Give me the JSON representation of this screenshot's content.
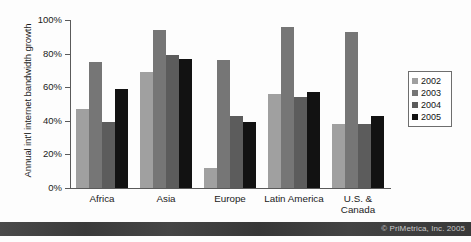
{
  "chart_data": {
    "type": "bar",
    "title": "",
    "subtitle": "",
    "xlabel": "",
    "ylabel": "Annual int'l internet bandwidth growth",
    "ylim": [
      0,
      100
    ],
    "yticks": [
      "0%",
      "20%",
      "40%",
      "60%",
      "80%",
      "100%"
    ],
    "ytick_values": [
      0,
      20,
      40,
      60,
      80,
      100
    ],
    "grid": false,
    "legend_position": "right",
    "categories": [
      "Africa",
      "Asia",
      "Europe",
      "Latin America",
      "U.S. &\nCanada"
    ],
    "series": [
      {
        "name": "2002",
        "color": "#a0a0a0",
        "values": [
          47,
          69,
          12,
          56,
          38
        ]
      },
      {
        "name": "2003",
        "color": "#767676",
        "values": [
          75,
          94,
          76,
          96,
          93
        ]
      },
      {
        "name": "2004",
        "color": "#5c5c5c",
        "values": [
          39,
          79,
          43,
          54,
          38
        ]
      },
      {
        "name": "2005",
        "color": "#121212",
        "values": [
          59,
          77,
          39,
          57,
          43
        ]
      }
    ]
  },
  "footer": {
    "credit": "© PriMetrica, Inc. 2005"
  }
}
